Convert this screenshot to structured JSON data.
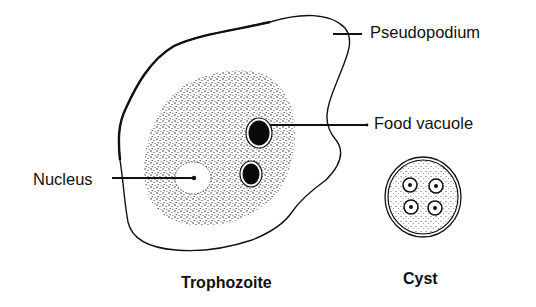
{
  "diagram": {
    "subjects": [
      {
        "id": "trophozoite",
        "caption": "Trophozoite",
        "parts": [
          {
            "id": "pseudopodium",
            "label": "Pseudopodium"
          },
          {
            "id": "food-vacuole",
            "label": "Food vacuole"
          },
          {
            "id": "nucleus",
            "label": "Nucleus"
          }
        ]
      },
      {
        "id": "cyst",
        "caption": "Cyst",
        "nuclei_count": 4
      }
    ],
    "colors": {
      "ink": "#111111",
      "background": "#ffffff",
      "stipple": "#222222"
    }
  }
}
